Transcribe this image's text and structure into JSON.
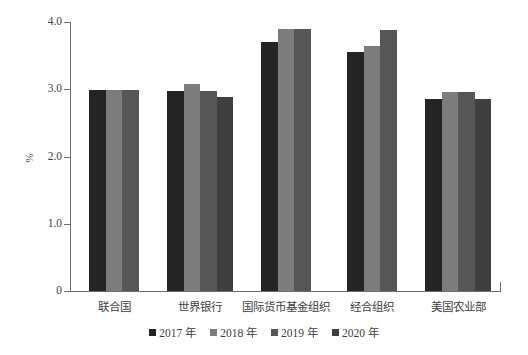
{
  "chart_data": {
    "type": "bar",
    "title": "",
    "xlabel": "",
    "ylabel": "%",
    "ylim": [
      0,
      4.0
    ],
    "yticks": [
      "0",
      "1.0",
      "2.0",
      "3.0",
      "4.0"
    ],
    "ytick_values": [
      0,
      1.0,
      2.0,
      3.0,
      4.0
    ],
    "grid": false,
    "legend_position": "bottom",
    "categories": [
      "联合国",
      "世界银行",
      "国际货币基金组织",
      "经合组织",
      "美国农业部"
    ],
    "series": [
      {
        "name": "2017 年",
        "color": "#242424",
        "values": [
          2.99,
          2.98,
          3.7,
          3.56,
          2.86
        ]
      },
      {
        "name": "2018 年",
        "color": "#7c7c7c",
        "values": [
          2.99,
          3.08,
          3.89,
          3.64,
          2.96
        ]
      },
      {
        "name": "2019 年",
        "color": "#565656",
        "values": [
          2.99,
          2.98,
          3.89,
          3.88,
          2.96
        ]
      },
      {
        "name": "2020 年",
        "color": "#3f3f3f",
        "values": [
          null,
          2.88,
          null,
          null,
          2.86
        ]
      }
    ]
  },
  "axes": {
    "y_title": "%",
    "y_tick_labels": [
      "4.0",
      "3.0",
      "2.0",
      "1.0",
      "0"
    ],
    "x_tick_labels": [
      "联合国",
      "世界银行",
      "国际货币基金组织",
      "经合组织",
      "美国农业部"
    ]
  },
  "legend": {
    "items": [
      {
        "label": "2017 年",
        "color": "#242424"
      },
      {
        "label": "2018 年",
        "color": "#7c7c7c"
      },
      {
        "label": "2019 年",
        "color": "#565656"
      },
      {
        "label": "2020 年",
        "color": "#3f3f3f"
      }
    ]
  },
  "colors": {
    "axis": "#6e6e6e",
    "text": "#3f3f3f",
    "background": "#ffffff"
  }
}
